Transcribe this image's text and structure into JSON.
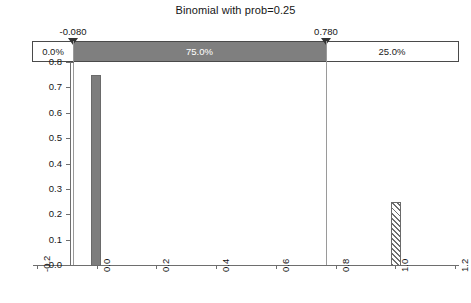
{
  "chart_data": {
    "type": "bar",
    "title": "Binomial with prob=0.25",
    "xlabel": "",
    "ylabel": "",
    "categories": [
      "0.0",
      "1.0"
    ],
    "x": [
      0.0,
      1.0
    ],
    "values": [
      0.75,
      0.25
    ],
    "bar_styles": [
      "solid",
      "hatched"
    ],
    "xlim": [
      -0.2,
      1.2
    ],
    "ylim": [
      0.0,
      0.8
    ],
    "xticks": [
      "-0.2",
      "0.0",
      "0.2",
      "0.4",
      "0.6",
      "0.8",
      "1.0",
      "1.2"
    ],
    "xtick_values": [
      -0.2,
      0.0,
      0.2,
      0.4,
      0.6,
      0.8,
      1.0,
      1.2
    ],
    "yticks": [
      "0.0",
      "0.1",
      "0.2",
      "0.3",
      "0.4",
      "0.5",
      "0.6",
      "0.7",
      "0.8"
    ],
    "ytick_values": [
      0.0,
      0.1,
      0.2,
      0.3,
      0.4,
      0.5,
      0.6,
      0.7,
      0.8
    ],
    "grid": false,
    "legend": "none",
    "reference_lines": [
      {
        "label": "-0.080",
        "value": -0.08
      },
      {
        "label": "0.780",
        "value": 0.78
      }
    ],
    "probability_segments": [
      {
        "label": "0.0%",
        "region": "below",
        "fill": "white",
        "percent": 0.0
      },
      {
        "label": "75.0%",
        "region": "between",
        "fill": "gray",
        "percent": 75.0
      },
      {
        "label": "25.0%",
        "region": "above",
        "fill": "white",
        "percent": 25.0
      }
    ]
  },
  "markers": {
    "left_label": "-0.080",
    "right_label": "0.780"
  },
  "colors": {
    "bar_fill": "#7d7d7d",
    "segment_fill": "#7f7f7f",
    "axis": "#6e6e6e",
    "reference_line": "#9a9a9a",
    "text": "#161616"
  }
}
